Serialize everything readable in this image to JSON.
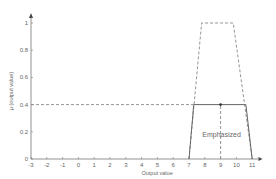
{
  "chart_data": {
    "type": "line",
    "title": "",
    "xlabel": "Output value",
    "ylabel": "μ (output value)",
    "xlim": [
      -3,
      11.5
    ],
    "ylim": [
      0,
      1.05
    ],
    "x_ticks": [
      -3,
      -2,
      -1,
      0,
      1,
      2,
      3,
      4,
      5,
      6,
      7,
      8,
      9,
      10,
      11
    ],
    "y_ticks": [
      0,
      0.2,
      0.4,
      0.6,
      0.8,
      1
    ],
    "y_tick_labels": [
      "0",
      "0.2",
      "0.4",
      "0.6",
      "0.8",
      "1"
    ],
    "grid": false,
    "series": [
      {
        "name": "Emphasized membership (full)",
        "style": "dashed",
        "points": [
          [
            7,
            0
          ],
          [
            7.8,
            1
          ],
          [
            9.8,
            1
          ],
          [
            11,
            0
          ]
        ]
      },
      {
        "name": "Emphasized clipped at 0.4",
        "style": "solid",
        "points": [
          [
            7,
            0
          ],
          [
            7.3,
            0.4
          ],
          [
            10.6,
            0.4
          ],
          [
            11,
            0
          ]
        ]
      },
      {
        "name": "Clip level",
        "style": "dashed",
        "points": [
          [
            -3,
            0.4
          ],
          [
            7.3,
            0.4
          ]
        ]
      },
      {
        "name": "Centroid marker",
        "style": "dashed",
        "points": [
          [
            9,
            0
          ],
          [
            9,
            0.4
          ]
        ]
      }
    ],
    "annotations": [
      {
        "text": "Emphasized",
        "x": 9,
        "y": 0.2
      }
    ],
    "marker_point": [
      9,
      0.4
    ]
  }
}
